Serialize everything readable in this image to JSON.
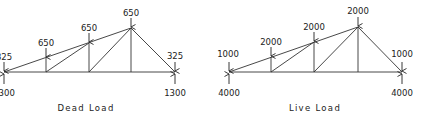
{
  "diagrams": [
    {
      "caption": "Dead Load",
      "support_left": {
        "load": "325",
        "reaction": "1300"
      },
      "node1": {
        "load": "650"
      },
      "node2": {
        "load": "650"
      },
      "apex": {
        "load": "650"
      },
      "support_right": {
        "load": "325",
        "reaction": "1300"
      }
    },
    {
      "caption": "Live Load",
      "support_left": {
        "load": "1000",
        "reaction": "4000"
      },
      "node1": {
        "load": "2000"
      },
      "node2": {
        "load": "2000"
      },
      "apex": {
        "load": "2000"
      },
      "support_right": {
        "load": "1000",
        "reaction": "4000"
      }
    }
  ]
}
